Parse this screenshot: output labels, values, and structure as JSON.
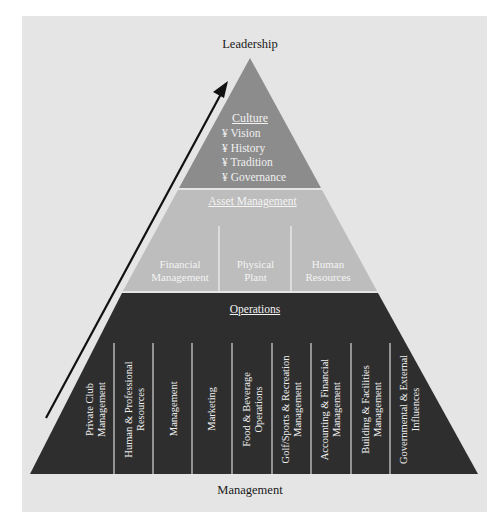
{
  "diagram": {
    "type": "pyramid",
    "top_label": "Leadership",
    "bottom_label": "Management",
    "arrow": {
      "direction": "up",
      "meaning": "from Management to Leadership"
    },
    "colors": {
      "background": "#e5e5e5",
      "culture_tier": "#8c8c8c",
      "asset_tier": "#bdbdbd",
      "operations_tier": "#2e2e2e",
      "divider": "#f2f2f2",
      "arrow": "#111111"
    },
    "tiers": {
      "culture": {
        "title": "Culture",
        "bullet_glyph": "¥",
        "items": [
          "Vision",
          "History",
          "Tradition",
          "Governance"
        ]
      },
      "asset": {
        "title": "Asset Management",
        "columns": [
          {
            "line1": "Financial",
            "line2": "Management"
          },
          {
            "line1": "Physical",
            "line2": "Plant"
          },
          {
            "line1": "Human",
            "line2": "Resources"
          }
        ]
      },
      "operations": {
        "title": "Operations",
        "columns": [
          {
            "line1": "Private Club",
            "line2": "Management"
          },
          {
            "line1": "Human & Professional",
            "line2": "Resources"
          },
          {
            "line1": "Management",
            "line2": ""
          },
          {
            "line1": "Marketing",
            "line2": ""
          },
          {
            "line1": "Food & Beverage",
            "line2": "Operations"
          },
          {
            "line1": "Golf/Sports & Recreation",
            "line2": "Management"
          },
          {
            "line1": "Accounting & Financial",
            "line2": "Management"
          },
          {
            "line1": "Building & Facilities",
            "line2": "Management"
          },
          {
            "line1": "Governmental & External",
            "line2": "Influences"
          }
        ]
      }
    }
  },
  "bullets_rendered": {
    "b0": "¥ Vision",
    "b1": "¥ History",
    "b2": "¥ Tradition",
    "b3": "¥ Governance"
  }
}
